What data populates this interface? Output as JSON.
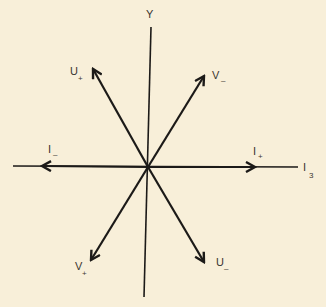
{
  "diagram": {
    "background_color": "#f8efd9",
    "ink_color": "#1c1a18",
    "axes": {
      "horizontal": {
        "label": "I",
        "subscript": "3"
      },
      "vertical": {
        "label": "Y",
        "subscript": ""
      }
    },
    "vectors": [
      {
        "id": "i-plus",
        "label": "I",
        "subscript": "+",
        "angle_deg": 0
      },
      {
        "id": "v-minus",
        "label": "V",
        "subscript": "-",
        "angle_deg": 60
      },
      {
        "id": "u-plus",
        "label": "U",
        "subscript": "+",
        "angle_deg": 120
      },
      {
        "id": "i-minus",
        "label": "I",
        "subscript": "-",
        "angle_deg": 180
      },
      {
        "id": "v-plus",
        "label": "V",
        "subscript": "+",
        "angle_deg": 240
      },
      {
        "id": "u-minus",
        "label": "U",
        "subscript": "-",
        "angle_deg": 300
      }
    ]
  }
}
